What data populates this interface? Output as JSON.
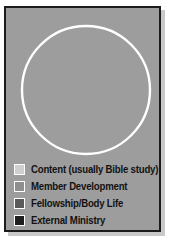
{
  "figure": {
    "background_color": "#9d9d9d",
    "frame_color": "#1c1c1c",
    "divider_color": "#ffffff"
  },
  "chart_data": {
    "type": "pie",
    "title": "",
    "subtitle": "",
    "xlabel": "",
    "ylabel": "",
    "grid": false,
    "legend_position": "bottom-left",
    "start_angle_deg": 0,
    "direction": "clockwise",
    "categories": [
      "Content (usually Bible study)",
      "Member Development",
      "Fellowship/Body Life",
      "External Ministry"
    ],
    "values": [
      39,
      7,
      31,
      23
    ],
    "units": "percent",
    "colors": [
      "#cfcfcf",
      "#8f8f8f",
      "#5a5a5a",
      "#1e1e1e"
    ],
    "slices": [
      {
        "label": "Content (usually Bible study)",
        "value": 39,
        "color": "#cfcfcf",
        "start_deg": 0,
        "end_deg": 140
      },
      {
        "label": "External Ministry",
        "value": 23,
        "color": "#1e1e1e",
        "start_deg": 140,
        "end_deg": 223
      },
      {
        "label": "Fellowship/Body Life",
        "value": 31,
        "color": "#5a5a5a",
        "start_deg": 223,
        "end_deg": 335
      },
      {
        "label": "Member Development",
        "value": 7,
        "color": "#8f8f8f",
        "start_deg": 335,
        "end_deg": 360
      }
    ]
  },
  "legend": {
    "items": [
      {
        "label": "Content (usually Bible study)",
        "color": "#cfcfcf"
      },
      {
        "label": "Member Development",
        "color": "#8f8f8f"
      },
      {
        "label": "Fellowship/Body Life",
        "color": "#5a5a5a"
      },
      {
        "label": "External Ministry",
        "color": "#1e1e1e"
      }
    ]
  }
}
